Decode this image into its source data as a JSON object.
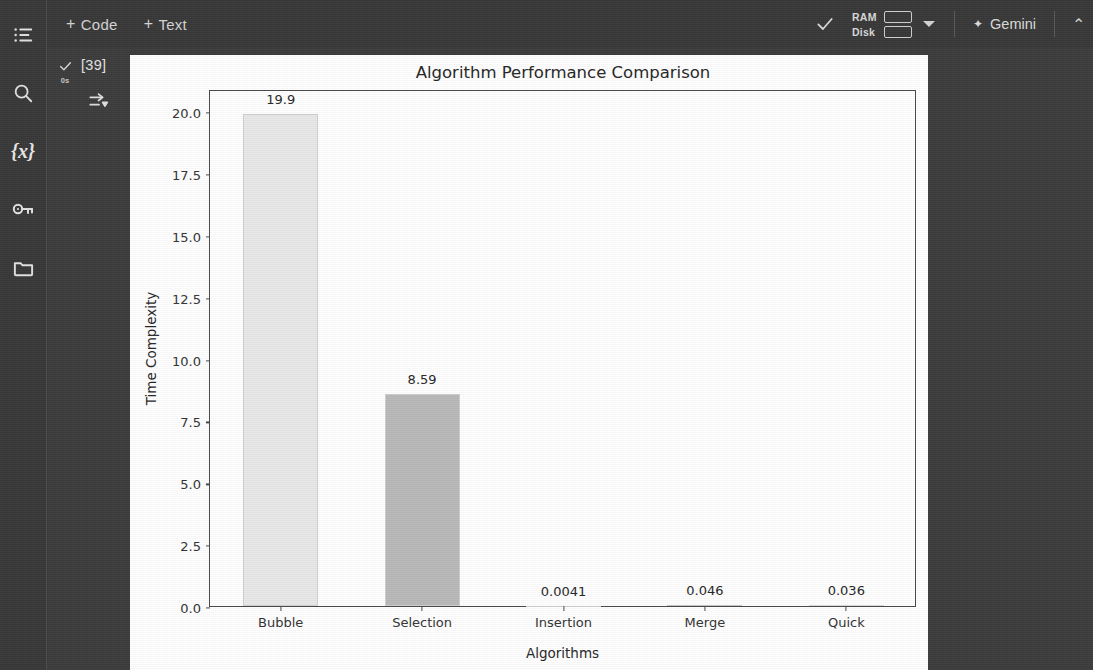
{
  "app": {
    "background": "#383838",
    "panel_background": "#ffffff"
  },
  "toolbar": {
    "add_code_label": "+ Code",
    "add_text_label": "+ Text",
    "plus": "+",
    "code_label": "Code",
    "text_label": "Text",
    "ram_label": "RAM",
    "disk_label": "Disk",
    "gemini_label": "Gemini",
    "gemini_spark": "✦",
    "edge_caret": "⌃"
  },
  "sidebar": {
    "items": [
      {
        "icon": "table-of-contents-icon",
        "label": "Table of contents"
      },
      {
        "icon": "search-icon",
        "label": "Find and replace"
      },
      {
        "icon": "variables-icon",
        "label": "{x}"
      },
      {
        "icon": "key-icon",
        "label": "Secrets"
      },
      {
        "icon": "folder-icon",
        "label": "Files"
      }
    ],
    "variables_glyph": "{x}"
  },
  "cell": {
    "execution_count": "[39]",
    "run_time": "0s",
    "status_check": "✓",
    "output_icon": "output-toggle-icon"
  },
  "chart_data": {
    "type": "bar",
    "title": "Algorithm Performance Comparison",
    "xlabel": "Algorithms",
    "ylabel": "Time Complexity",
    "categories": [
      "Bubble",
      "Selection",
      "Insertion",
      "Merge",
      "Quick"
    ],
    "values": [
      19.9,
      8.59,
      0.0041,
      0.046,
      0.036
    ],
    "value_labels": [
      "19.9",
      "8.59",
      "0.0041",
      "0.046",
      "0.036"
    ],
    "bar_colors": [
      "#e9e9e9",
      "#b9b9b9",
      "#cfcfcf",
      "#c4c4c4",
      "#dadada"
    ],
    "bar_edge_color": "#d0d0d0",
    "ylim": [
      0.0,
      20.9
    ],
    "yticks": [
      0.0,
      2.5,
      5.0,
      7.5,
      10.0,
      12.5,
      15.0,
      17.5,
      20.0
    ],
    "ytick_labels": [
      "0.0",
      "2.5",
      "5.0",
      "7.5",
      "10.0",
      "12.5",
      "15.0",
      "17.5",
      "20.0"
    ],
    "grid": false,
    "legend": null
  }
}
